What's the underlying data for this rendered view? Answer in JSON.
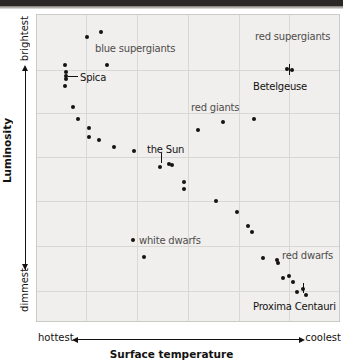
{
  "figure": {
    "kind": "hertzsprung-russell-diagram"
  },
  "axes": {
    "y_title": "Luminosity",
    "y_high_label": "brightest",
    "y_low_label": "dimmest",
    "x_title": "Surface temperature",
    "x_left_label": "hottest",
    "x_right_label": "coolest"
  },
  "style": {
    "plot_background": "#f0efee",
    "gridline_color": "#d8d7d4",
    "plot_border": "#cbcac7",
    "point_color": "#15130f",
    "group_label_color": "#4f4d4a",
    "star_label_color": "#141210"
  },
  "chart_data": {
    "type": "scatter",
    "title": "",
    "xlabel": "Surface temperature",
    "ylabel": "Luminosity",
    "xlim_labels": [
      "hottest",
      "coolest"
    ],
    "ylim_labels": [
      "dimmest",
      "brightest"
    ],
    "grid": true,
    "legend": "none",
    "x_axis_direction": "hottest-to-coolest",
    "y_axis_direction": "dimmest-to-brightest",
    "x_gridlines_px": [
      36,
      85,
      136,
      187,
      238,
      288
    ],
    "y_gridlines_px": [
      69,
      112,
      156,
      200,
      245,
      290
    ],
    "annotations": [
      {
        "text": "blue supergiants",
        "x_px": 94,
        "y_px": 42,
        "kind": "group",
        "align": "left"
      },
      {
        "text": "red supergiants",
        "x_px": 254,
        "y_px": 30,
        "kind": "group",
        "align": "left"
      },
      {
        "text": "red giants",
        "x_px": 190,
        "y_px": 101,
        "kind": "group",
        "align": "left"
      },
      {
        "text": "white dwarfs",
        "x_px": 138,
        "y_px": 234,
        "kind": "group",
        "align": "left"
      },
      {
        "text": "red dwarfs",
        "x_px": 281,
        "y_px": 249,
        "kind": "group",
        "align": "left"
      },
      {
        "text": "Spica",
        "x_px": 79,
        "y_px": 71,
        "kind": "star",
        "align": "left"
      },
      {
        "text": "Betelgeuse",
        "x_px": 252,
        "y_px": 80,
        "kind": "star",
        "align": "left"
      },
      {
        "text": "the Sun",
        "x_px": 146,
        "y_px": 143,
        "kind": "star",
        "align": "left"
      },
      {
        "text": "Proxima Centauri",
        "x_px": 252,
        "y_px": 300,
        "kind": "star",
        "align": "left"
      }
    ],
    "leaders": [
      {
        "for": "Spica",
        "orientation": "horizontal",
        "x_px": 67,
        "y_px": 75,
        "length_px": 10
      },
      {
        "for": "Betelgeuse",
        "orientation": "vertical",
        "x_px": 288,
        "y_px": 63,
        "length_px": 11
      },
      {
        "for": "the Sun",
        "orientation": "vertical",
        "x_px": 160,
        "y_px": 152,
        "length_px": 10
      },
      {
        "for": "Proxima Centauri",
        "orientation": "vertical",
        "x_px": 302,
        "y_px": 282,
        "length_px": 10
      }
    ],
    "points": [
      {
        "x_px": 100,
        "y_px": 31
      },
      {
        "x_px": 86,
        "y_px": 36
      },
      {
        "x_px": 64,
        "y_px": 64
      },
      {
        "x_px": 106,
        "y_px": 64
      },
      {
        "x_px": 65,
        "y_px": 71
      },
      {
        "x_px": 65,
        "y_px": 75
      },
      {
        "x_px": 65,
        "y_px": 78
      },
      {
        "x_px": 64,
        "y_px": 85
      },
      {
        "x_px": 72,
        "y_px": 106
      },
      {
        "x_px": 77,
        "y_px": 118
      },
      {
        "x_px": 88,
        "y_px": 127
      },
      {
        "x_px": 88,
        "y_px": 136
      },
      {
        "x_px": 98,
        "y_px": 139
      },
      {
        "x_px": 113,
        "y_px": 146
      },
      {
        "x_px": 133,
        "y_px": 150
      },
      {
        "x_px": 159,
        "y_px": 166
      },
      {
        "x_px": 168,
        "y_px": 163
      },
      {
        "x_px": 171,
        "y_px": 164
      },
      {
        "x_px": 183,
        "y_px": 181
      },
      {
        "x_px": 183,
        "y_px": 188
      },
      {
        "x_px": 197,
        "y_px": 129
      },
      {
        "x_px": 222,
        "y_px": 121
      },
      {
        "x_px": 253,
        "y_px": 118
      },
      {
        "x_px": 286,
        "y_px": 68
      },
      {
        "x_px": 291,
        "y_px": 69
      },
      {
        "x_px": 215,
        "y_px": 200
      },
      {
        "x_px": 236,
        "y_px": 211
      },
      {
        "x_px": 247,
        "y_px": 225
      },
      {
        "x_px": 251,
        "y_px": 231
      },
      {
        "x_px": 132,
        "y_px": 239
      },
      {
        "x_px": 143,
        "y_px": 256
      },
      {
        "x_px": 262,
        "y_px": 257
      },
      {
        "x_px": 276,
        "y_px": 259
      },
      {
        "x_px": 277,
        "y_px": 262
      },
      {
        "x_px": 282,
        "y_px": 277
      },
      {
        "x_px": 288,
        "y_px": 275
      },
      {
        "x_px": 292,
        "y_px": 281
      },
      {
        "x_px": 296,
        "y_px": 291
      },
      {
        "x_px": 302,
        "y_px": 288
      },
      {
        "x_px": 305,
        "y_px": 294
      }
    ]
  }
}
